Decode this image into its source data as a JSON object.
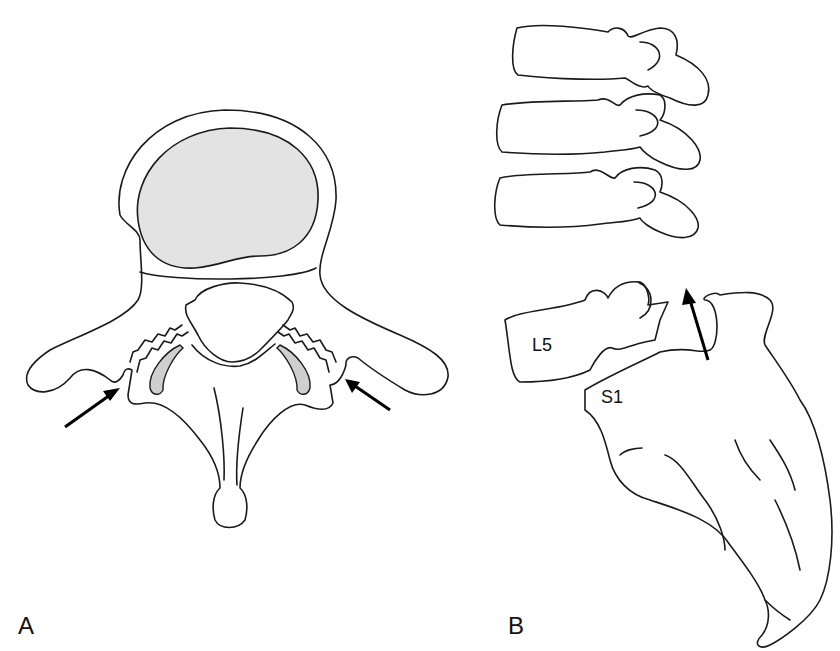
{
  "figure": {
    "panels": [
      {
        "id": "A",
        "label": "A",
        "view": "axial vertebra",
        "annotations": [
          "left-arrow",
          "right-arrow"
        ]
      },
      {
        "id": "B",
        "label": "B",
        "view": "lateral lumbosacral spine",
        "vertebra_labels": [
          "L5",
          "S1"
        ],
        "annotations": [
          "upward-arrow"
        ]
      }
    ]
  },
  "colors": {
    "stroke": "#1a1a1a",
    "vertebral_body_fill": "#e3e3e3",
    "facet_fill": "#cfcfcf",
    "background": "#ffffff"
  }
}
